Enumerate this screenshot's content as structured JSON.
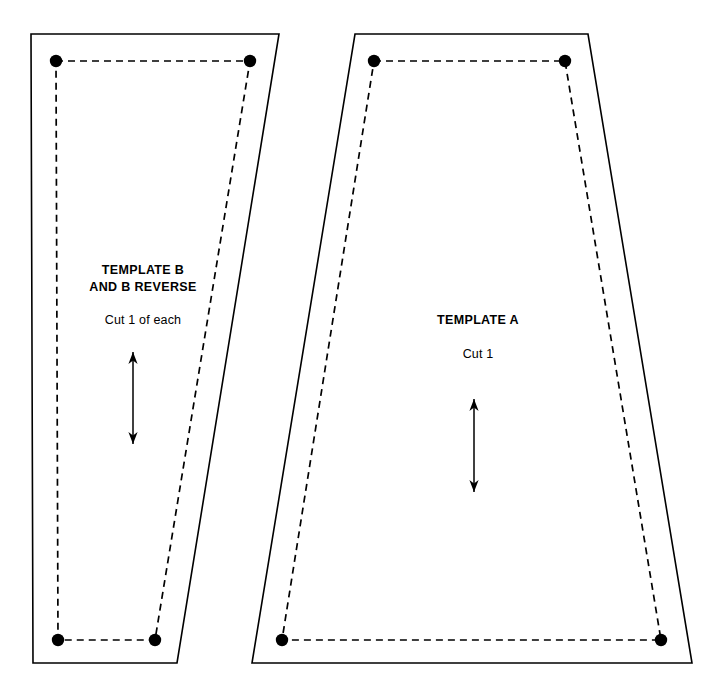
{
  "page": {
    "background_color": "#ffffff",
    "line_color": "#000000",
    "width": 721,
    "height": 700
  },
  "pieces": [
    {
      "id": "template-b",
      "title_line_1": "TEMPLATE B",
      "title_line_2": "AND B REVERSE",
      "cut_instruction": "Cut 1 of each",
      "cutting_line_points": "31,34 279,34 177,663 33,663",
      "seam_line_points": "56,61 250,61 155,640 58,640",
      "seam_dots": [
        {
          "cx": 56,
          "cy": 61
        },
        {
          "cx": 250,
          "cy": 61
        },
        {
          "cx": 155,
          "cy": 640
        },
        {
          "cx": 58,
          "cy": 640
        }
      ],
      "grainline": {
        "x": 133,
        "y_top": 352,
        "y_bottom": 444
      }
    },
    {
      "id": "template-a",
      "title_line_1": "TEMPLATE A",
      "title_line_2": "",
      "cut_instruction": "Cut 1",
      "cutting_line_points": "355,34 588,34 692,663 252,663",
      "seam_line_points": "374,61 565,61 661,640 282,640",
      "seam_dots": [
        {
          "cx": 374,
          "cy": 61
        },
        {
          "cx": 565,
          "cy": 61
        },
        {
          "cx": 661,
          "cy": 640
        },
        {
          "cx": 282,
          "cy": 640
        }
      ],
      "grainline": {
        "x": 474,
        "y_top": 399,
        "y_bottom": 492
      }
    }
  ],
  "legend": {
    "cutting_line_name": "solid cutting line",
    "seam_line_name": "dashed stitching line",
    "dot_name": "corner match point",
    "grainline_name": "grainline arrow"
  }
}
